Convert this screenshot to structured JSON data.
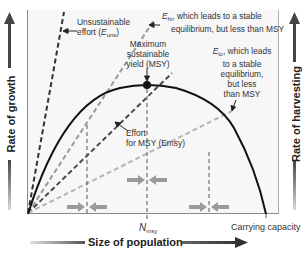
{
  "diagram": {
    "type": "harvesting-vs-growth",
    "axes": {
      "x_title": "Size of population",
      "y_left_title": "Rate of growth",
      "y_right_title": "Rate of harvesting",
      "x_tick_nmsy_main": "N",
      "x_tick_nmsy_sub": "msy",
      "x_tick_carrying": "Carrying capacity"
    },
    "annotations": {
      "uns_line1": "Unsustainable",
      "uns_line2_pre": "effort (",
      "uns_E": "E",
      "uns_sub": "uns",
      "uns_post": ")",
      "hi_E": "E",
      "hi_sub": "hi",
      "hi_text1": ", which leads to a stable",
      "hi_text2": "equilibrium, but less than MSY",
      "msy_line1": "Maximum",
      "msy_line2": "sustainable",
      "msy_line3": "yield (MSY)",
      "lo_E": "E",
      "lo_sub": "lo",
      "lo_text1": ", which leads",
      "lo_text2": "to a stable",
      "lo_text3": "equilibrium,",
      "lo_text4": "but less",
      "lo_text5": "than MSY",
      "emsy_line1": "Effort",
      "emsy_line2": "for MSY (Emsy)"
    },
    "colors": {
      "curve": "#111111",
      "uns_line": "#333333",
      "msy_line": "#4a4a4a",
      "hi_line": "#9a9a9a",
      "lo_line": "#b5b5b5",
      "arrows": "#9a9a9a",
      "frame_bg": "#f7f7f7"
    }
  }
}
